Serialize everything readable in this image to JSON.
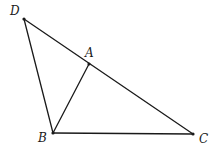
{
  "figure": {
    "type": "triangle-geometry",
    "points": [
      {
        "id": "D",
        "label": "D",
        "x": 24,
        "y": 19,
        "lx": 10,
        "ly": 15
      },
      {
        "id": "A",
        "label": "A",
        "x": 89,
        "y": 64,
        "lx": 85,
        "ly": 57
      },
      {
        "id": "B",
        "label": "B",
        "x": 53,
        "y": 133,
        "lx": 38,
        "ly": 142
      },
      {
        "id": "C",
        "label": "C",
        "x": 193,
        "y": 134,
        "lx": 199,
        "ly": 143
      }
    ],
    "segments": [
      {
        "from": "D",
        "to": "C"
      },
      {
        "from": "D",
        "to": "B"
      },
      {
        "from": "B",
        "to": "C"
      },
      {
        "from": "B",
        "to": "A"
      }
    ]
  }
}
